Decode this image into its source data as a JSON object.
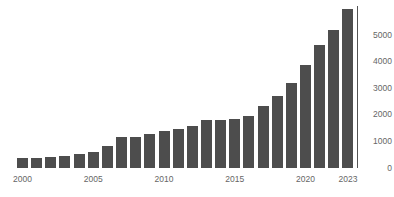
{
  "chart_data": {
    "type": "bar",
    "title": "",
    "subtitle": "",
    "xlabel": "",
    "ylabel": "",
    "grid": false,
    "legend": null,
    "bar_color": "#4d4d4d",
    "background_color": "#ffffff",
    "axis_color": "#555555",
    "tick_label_color": "#666666",
    "categories": [
      "2000",
      "2001",
      "2002",
      "2003",
      "2004",
      "2005",
      "2006",
      "2007",
      "2008",
      "2009",
      "2010",
      "2011",
      "2012",
      "2013",
      "2014",
      "2015",
      "2016",
      "2017",
      "2018",
      "2019",
      "2020",
      "2021",
      "2022",
      "2023"
    ],
    "values": [
      370,
      390,
      420,
      470,
      510,
      620,
      840,
      1180,
      1150,
      1260,
      1400,
      1450,
      1580,
      1800,
      1790,
      1860,
      1960,
      2320,
      2700,
      3180,
      3880,
      4640,
      5180,
      5960
    ],
    "ylim": [
      0,
      5960
    ],
    "yticks": [
      0,
      1000,
      2000,
      3000,
      4000,
      5000
    ],
    "ytick_labels": [
      "0",
      "1000",
      "2000",
      "3000",
      "4000",
      "5000"
    ],
    "xticks": [
      "2000",
      "2005",
      "2010",
      "2015",
      "2020",
      "2023"
    ],
    "xtick_indices": [
      0,
      5,
      10,
      15,
      20,
      23
    ],
    "y_axis_position": "right",
    "annotations": []
  },
  "geometry": {
    "baseline_y": 168,
    "value_per_pixel": 37.6,
    "bar_pitch": 14.15,
    "bar_width": 11,
    "plot_left": 17
  }
}
